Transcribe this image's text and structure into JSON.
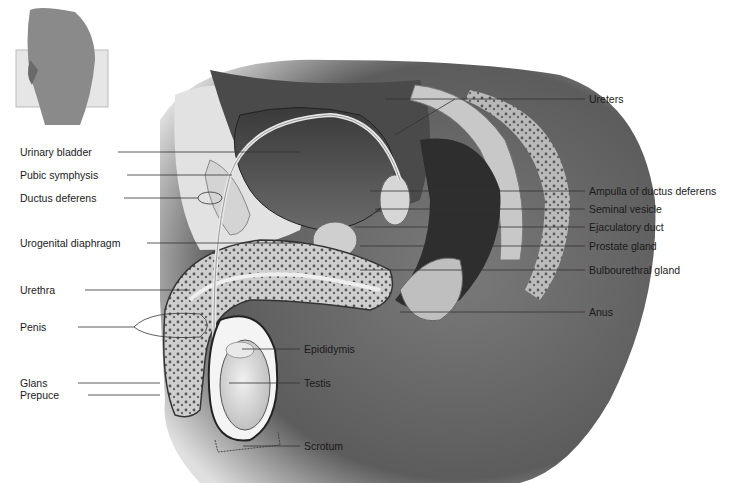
{
  "diagram": {
    "inset": {
      "description": "orientation thumbnail of lateral pelvis view",
      "present": true
    },
    "labels_left": [
      {
        "id": "urinary-bladder",
        "text": "Urinary bladder",
        "x": 20,
        "y": 146
      },
      {
        "id": "pubic-symphysis",
        "text": "Pubic symphysis",
        "x": 20,
        "y": 169
      },
      {
        "id": "ductus-deferens",
        "text": "Ductus deferens",
        "x": 20,
        "y": 192
      },
      {
        "id": "urogenital-diaphragm",
        "text": "Urogenital diaphragm",
        "x": 20,
        "y": 236
      },
      {
        "id": "urethra",
        "text": "Urethra",
        "x": 20,
        "y": 284
      },
      {
        "id": "penis",
        "text": "Penis",
        "x": 20,
        "y": 321
      },
      {
        "id": "glans",
        "text": "Glans",
        "x": 20,
        "y": 377
      },
      {
        "id": "prepuce",
        "text": "Prepuce",
        "x": 20,
        "y": 389
      }
    ],
    "labels_right": [
      {
        "id": "ureters",
        "text": "Ureters",
        "x": 589,
        "y": 95
      },
      {
        "id": "ampulla",
        "text": "Ampulla of ductus deferens",
        "x": 589,
        "y": 187
      },
      {
        "id": "seminal-vesicle",
        "text": "Seminal vesicle",
        "x": 589,
        "y": 205
      },
      {
        "id": "ejaculatory-duct",
        "text": "Ejaculatory duct",
        "x": 589,
        "y": 222
      },
      {
        "id": "prostate-gland",
        "text": "Prostate gland",
        "x": 589,
        "y": 240
      },
      {
        "id": "bulbourethral-gland",
        "text": "Bulbourethral gland",
        "x": 589,
        "y": 264
      },
      {
        "id": "anus",
        "text": "Anus",
        "x": 589,
        "y": 307
      }
    ],
    "labels_center": [
      {
        "id": "epididymis",
        "text": "Epididymis",
        "x": 304,
        "y": 344
      },
      {
        "id": "testis",
        "text": "Testis",
        "x": 304,
        "y": 378
      },
      {
        "id": "scrotum",
        "text": "Scrotum",
        "x": 304,
        "y": 441
      }
    ],
    "colors": {
      "background": "#ffffff",
      "text": "#1a1a1a",
      "leader_line": "#333333",
      "skin_dark": "#5a5a5a",
      "tissue_light": "#d8d8d8"
    }
  }
}
